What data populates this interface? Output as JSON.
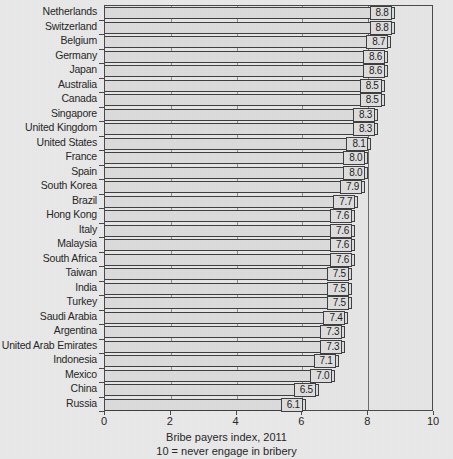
{
  "chart_data": {
    "type": "bar",
    "orientation": "horizontal",
    "title": "",
    "xlabel": "Bribe payers index, 2011",
    "ylabel": "",
    "xlim": [
      0,
      10
    ],
    "xticks": [
      0,
      2,
      4,
      6,
      8,
      10
    ],
    "xtick_labels": [
      "0",
      "2",
      "4",
      "6",
      "8",
      "10"
    ],
    "grid": true,
    "legend": false,
    "categories": [
      "Netherlands",
      "Switzerland",
      "Belgium",
      "Germany",
      "Japan",
      "Australia",
      "Canada",
      "Singapore",
      "United Kingdom",
      "United States",
      "France",
      "Spain",
      "South Korea",
      "Brazil",
      "Hong Kong",
      "Italy",
      "Malaysia",
      "South Africa",
      "Taiwan",
      "India",
      "Turkey",
      "Saudi Arabia",
      "Argentina",
      "United Arab Emirates",
      "Indonesia",
      "Mexico",
      "China",
      "Russia"
    ],
    "values": [
      8.8,
      8.8,
      8.7,
      8.6,
      8.6,
      8.5,
      8.5,
      8.3,
      8.3,
      8.1,
      8.0,
      8.0,
      7.9,
      7.7,
      7.6,
      7.6,
      7.6,
      7.6,
      7.5,
      7.5,
      7.5,
      7.4,
      7.3,
      7.3,
      7.1,
      7.0,
      6.5,
      6.1
    ],
    "value_labels": [
      "8.8",
      "8.8",
      "8.7",
      "8.6",
      "8.6",
      "8.5",
      "8.5",
      "8.3",
      "8.3",
      "8.1",
      "8.0",
      "8.0",
      "7.9",
      "7.7",
      "7.6",
      "7.6",
      "7.6",
      "7.6",
      "7.5",
      "7.5",
      "7.5",
      "7.4",
      "7.3",
      "7.3",
      "7.1",
      "7.0",
      "6.5",
      "6.1"
    ],
    "caption_line1": "Bribe payers index, 2011",
    "caption_line2": "10 = never engage in bribery",
    "colors": {
      "background": "#e9e9e9",
      "plot_background": "#e6e6e6",
      "bar_fill": "#dcdcdc",
      "bar_edge": "#3f3f3f",
      "axis": "#4a4a4a",
      "text": "#262626"
    }
  }
}
